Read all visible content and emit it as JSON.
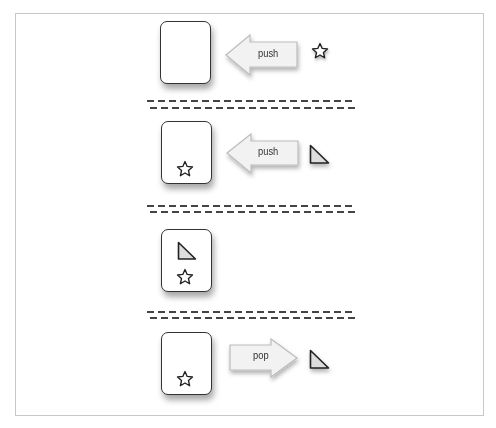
{
  "diagram": {
    "type": "stack push/pop illustration",
    "steps": [
      {
        "operation": "push",
        "arrow_label": "push",
        "arrow_direction": "left",
        "item": "star",
        "stack_contents": []
      },
      {
        "operation": "push",
        "arrow_label": "push",
        "arrow_direction": "left",
        "item": "triangle",
        "stack_contents": [
          "star"
        ]
      },
      {
        "operation": "state",
        "arrow_label": null,
        "item": null,
        "stack_contents": [
          "triangle",
          "star"
        ]
      },
      {
        "operation": "pop",
        "arrow_label": "pop",
        "arrow_direction": "right",
        "item": "triangle",
        "stack_contents": [
          "star"
        ]
      }
    ],
    "labels": {
      "push1": "push",
      "push2": "push",
      "pop": "pop"
    },
    "colors": {
      "outline": "#333333",
      "arrow_fill": "#f2f2f2",
      "arrow_stroke": "#bbbbbb",
      "triangle_fill": "#dddddd",
      "dash": "#444444",
      "frame": "#c8c8c8"
    }
  }
}
